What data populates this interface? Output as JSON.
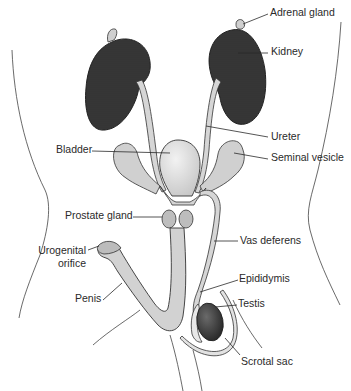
{
  "diagram": {
    "labels": {
      "adrenal_gland": "Adrenal gland",
      "kidney": "Kidney",
      "ureter": "Ureter",
      "bladder": "Bladder",
      "seminal_vesicle": "Seminal vesicle",
      "prostate_gland": "Prostate gland",
      "vas_deferens": "Vas deferens",
      "urogenital_orifice_line1": "Urogenital",
      "urogenital_orifice_line2": "orifice",
      "epididymis": "Epididymis",
      "testis": "Testis",
      "penis": "Penis",
      "scrotal_sac": "Scrotal sac"
    },
    "colors": {
      "kidney": "#3c3c3c",
      "organ_fill": "#d4d4d4",
      "bladder_fill": "#e6e6e6",
      "outline": "#333333",
      "leader_line": "#2a2a2a",
      "text": "#2a2a2a"
    }
  }
}
